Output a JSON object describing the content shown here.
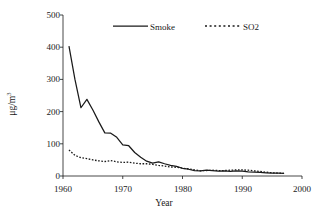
{
  "chart_data": {
    "type": "line",
    "title": "",
    "xlabel": "Year",
    "ylabel": "μg/m",
    "ylabel_sup": "3",
    "xlim": [
      1960,
      2000
    ],
    "ylim": [
      0,
      500
    ],
    "grid": false,
    "legend_position": "top-center",
    "xticks": [
      "1960",
      "1970",
      "1980",
      "1990",
      "2000"
    ],
    "xtick_values": [
      1960,
      1970,
      1980,
      1990,
      2000
    ],
    "yticks": [
      "0",
      "100",
      "200",
      "300",
      "400",
      "500"
    ],
    "ytick_values": [
      0,
      100,
      200,
      300,
      400,
      500
    ],
    "x": [
      1961,
      1962,
      1963,
      1964,
      1965,
      1966,
      1967,
      1968,
      1969,
      1970,
      1971,
      1972,
      1973,
      1974,
      1975,
      1976,
      1977,
      1978,
      1979,
      1980,
      1981,
      1982,
      1983,
      1984,
      1985,
      1986,
      1987,
      1988,
      1989,
      1990,
      1991,
      1992,
      1993,
      1994,
      1995,
      1996,
      1997
    ],
    "series": [
      {
        "name": "Smoke",
        "style": "solid",
        "color": "#1a1a1a",
        "values": [
          403,
          300,
          212,
          238,
          205,
          168,
          134,
          133,
          120,
          97,
          94,
          73,
          58,
          46,
          40,
          44,
          38,
          33,
          30,
          24,
          21,
          17,
          16,
          18,
          17,
          15,
          16,
          14,
          16,
          15,
          13,
          12,
          11,
          10,
          9,
          9,
          8
        ]
      },
      {
        "name": "SO2",
        "style": "dotted",
        "color": "#1a1a1a",
        "values": [
          81,
          64,
          57,
          54,
          50,
          47,
          45,
          48,
          44,
          42,
          43,
          40,
          38,
          38,
          36,
          33,
          31,
          28,
          27,
          24,
          22,
          19,
          16,
          17,
          18,
          17,
          17,
          18,
          19,
          19,
          18,
          16,
          14,
          12,
          10,
          9,
          8
        ]
      }
    ]
  },
  "legend": {
    "items": [
      {
        "label": "Smoke",
        "style": "solid"
      },
      {
        "label": "SO2",
        "style": "dotted"
      }
    ]
  },
  "axes": {
    "x_title": "Year",
    "y_title_main": "μg/m",
    "y_title_sup": "3"
  }
}
